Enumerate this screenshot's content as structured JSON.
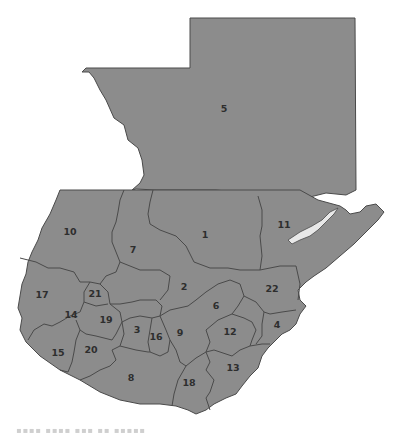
{
  "map": {
    "subject": "Guatemala departments map",
    "fill_color": "#8c8c8c",
    "border_color": "#4a4a4a",
    "lake_color": "#e8e8e8",
    "labels": [
      {
        "id": "5",
        "x": 224,
        "y": 112
      },
      {
        "id": "11",
        "x": 284,
        "y": 228
      },
      {
        "id": "10",
        "x": 70,
        "y": 235
      },
      {
        "id": "7",
        "x": 133,
        "y": 253
      },
      {
        "id": "1",
        "x": 205,
        "y": 238
      },
      {
        "id": "2",
        "x": 184,
        "y": 290
      },
      {
        "id": "22",
        "x": 272,
        "y": 292
      },
      {
        "id": "17",
        "x": 42,
        "y": 298
      },
      {
        "id": "21",
        "x": 95,
        "y": 297
      },
      {
        "id": "14",
        "x": 71,
        "y": 318
      },
      {
        "id": "19",
        "x": 106,
        "y": 323
      },
      {
        "id": "6",
        "x": 216,
        "y": 309
      },
      {
        "id": "3",
        "x": 137,
        "y": 333
      },
      {
        "id": "16",
        "x": 156,
        "y": 340
      },
      {
        "id": "9",
        "x": 180,
        "y": 336
      },
      {
        "id": "12",
        "x": 230,
        "y": 335
      },
      {
        "id": "4",
        "x": 277,
        "y": 328
      },
      {
        "id": "15",
        "x": 58,
        "y": 356
      },
      {
        "id": "20",
        "x": 91,
        "y": 353
      },
      {
        "id": "8",
        "x": 131,
        "y": 381
      },
      {
        "id": "18",
        "x": 189,
        "y": 386
      },
      {
        "id": "13",
        "x": 233,
        "y": 371
      }
    ]
  },
  "caption": {
    "text": "▪▪▪▪ ▪▪▪▪ ▪▪▪ ▪▪ ▪▪▪▪▪"
  }
}
